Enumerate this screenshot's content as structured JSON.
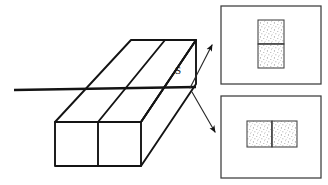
{
  "figure": {
    "type": "technical-section-drawing",
    "background_color": "#ffffff",
    "ink_color": "#141414",
    "stipple_color": "#9a9a9a"
  },
  "section_plane": {
    "label": "S",
    "label_x": 178,
    "label_y": 74,
    "line": {
      "x1": 14,
      "y1": 90,
      "x2": 196,
      "y2": 87
    },
    "line_width": 2.6
  },
  "solid": {
    "name": "rectangular-prism",
    "front_face": {
      "divider_label": "",
      "cell_count": 2
    },
    "outline_points": "55,122 55,166 141,166 141,122",
    "top_edge_points": "55,122 131,40 196,40 141,122",
    "right_edge_points": "141,122 196,40 196,84 141,166"
  },
  "arrows": [
    {
      "name": "arrow-to-top-view",
      "direction": "up-right",
      "x1": 190,
      "y1": 88,
      "x2": 213,
      "y2": 44,
      "target_panel": "top"
    },
    {
      "name": "arrow-to-bottom-view",
      "direction": "down-right",
      "x1": 192,
      "y1": 92,
      "x2": 216,
      "y2": 133,
      "target_panel": "bottom"
    }
  ],
  "panels": [
    {
      "id": "top-panel",
      "name": "cross-section-view-vertical",
      "frame": {
        "x": 221,
        "y": 6,
        "w": 100,
        "h": 78
      },
      "section": {
        "orientation": "vertical",
        "x": 258,
        "y": 20,
        "w": 26,
        "h": 48,
        "split": "horizontal",
        "cells": 2,
        "hatch": "stipple"
      }
    },
    {
      "id": "bottom-panel",
      "name": "cross-section-view-horizontal",
      "frame": {
        "x": 221,
        "y": 96,
        "w": 100,
        "h": 82
      },
      "section": {
        "orientation": "horizontal",
        "x": 247,
        "y": 121,
        "w": 50,
        "h": 26,
        "split": "vertical",
        "cells": 2,
        "hatch": "stipple"
      }
    }
  ]
}
